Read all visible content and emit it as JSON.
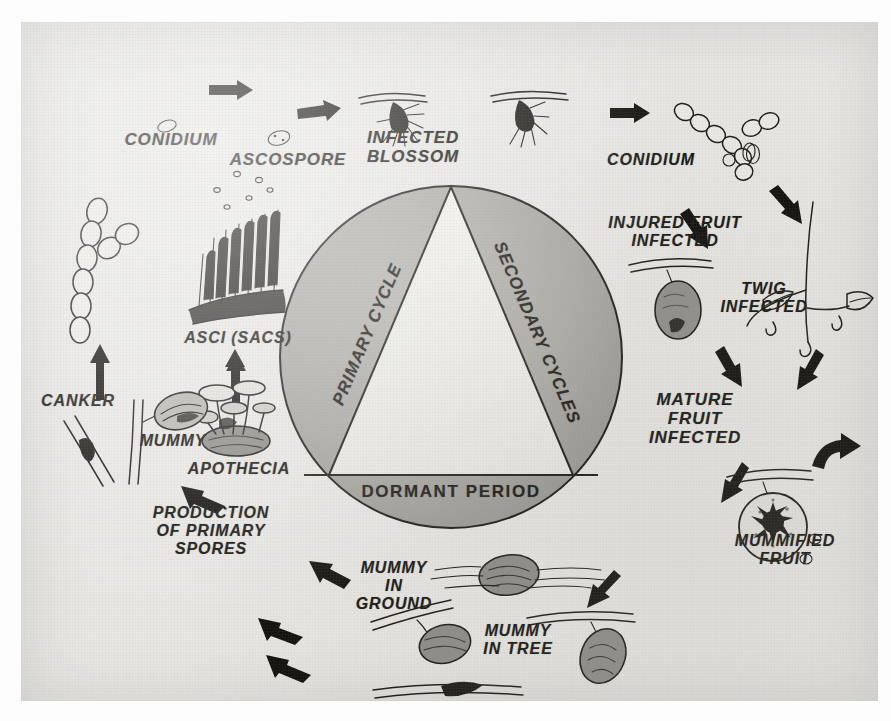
{
  "diagram": {
    "type": "cycle-diagram",
    "background_color": "#e8e7e4",
    "ink_color": "#1a1814",
    "wheel_fill_color": "#a9a7a2",
    "triangle_fill_color": "#efeeea"
  },
  "wheel": {
    "primary_label": "PRIMARY CYCLE",
    "secondary_label": "SECONDARY CYCLES",
    "dormant_label": "DORMANT PERIOD"
  },
  "stages": [
    {
      "id": "conidium-left",
      "label": "CONIDIUM"
    },
    {
      "id": "ascospore",
      "label": "ASCOSPORE"
    },
    {
      "id": "infected-blossom",
      "label": "INFECTED\nBLOSSOM"
    },
    {
      "id": "conidium-right",
      "label": "CONIDIUM"
    },
    {
      "id": "injured-fruit",
      "label": "INJURED FRUIT\nINFECTED"
    },
    {
      "id": "twig-infected",
      "label": "TWIG\nINFECTED"
    },
    {
      "id": "mature-fruit",
      "label": "MATURE\nFRUIT\nINFECTED"
    },
    {
      "id": "mummified-fruit",
      "label": "MUMMIFIED\nFRUIT"
    },
    {
      "id": "mummy-in-tree",
      "label": "MUMMY\nIN TREE"
    },
    {
      "id": "twig-canker",
      "label": "TWIG CANKER"
    },
    {
      "id": "mummy-in-ground",
      "label": "MUMMY\nIN\nGROUND"
    },
    {
      "id": "production-of-spores",
      "label": "PRODUCTION\nOF PRIMARY\nSPORES"
    },
    {
      "id": "apothecia",
      "label": "APOTHECIA"
    },
    {
      "id": "mummy",
      "label": "MUMMY"
    },
    {
      "id": "canker",
      "label": "CANKER"
    },
    {
      "id": "asci",
      "label": "ASCI (SACS)"
    }
  ]
}
